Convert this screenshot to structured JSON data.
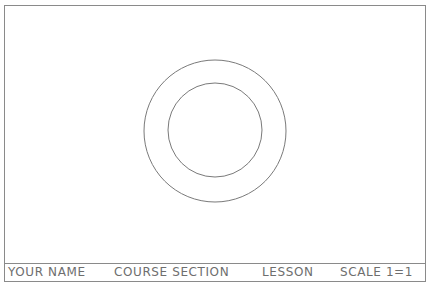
{
  "drawing": {
    "border": {
      "x": 4,
      "y": 5,
      "width": 421,
      "height": 276,
      "color": "#8a8a8a"
    },
    "title_block": {
      "divider_y": 263,
      "color": "#8a8a8a"
    },
    "circles": [
      {
        "name": "outer-circle",
        "cx": 215,
        "cy": 131,
        "r": 71,
        "color": "#7a7a7a"
      },
      {
        "name": "inner-circle",
        "cx": 215,
        "cy": 130,
        "r": 47,
        "color": "#7a7a7a"
      }
    ]
  },
  "title_block": {
    "fields": [
      {
        "label": "YOUR NAME",
        "x": 8
      },
      {
        "label": "COURSE SECTION",
        "x": 114
      },
      {
        "label": "LESSON",
        "x": 262
      },
      {
        "label": "SCALE 1=1",
        "x": 340
      }
    ]
  }
}
